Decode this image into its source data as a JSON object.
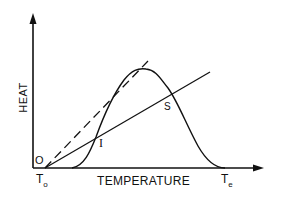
{
  "diagram": {
    "y_axis_label": "HEAT",
    "x_axis_label": "TEMPERATURE",
    "origin_label": "O",
    "t_start": {
      "main": "T",
      "sub": "o"
    },
    "t_end": {
      "main": "T",
      "sub": "e"
    },
    "points": {
      "intersection_i": "I",
      "intersection_s": "S"
    },
    "curves": [
      {
        "name": "heat-generation-curve",
        "style": "solid",
        "shape": "bell"
      },
      {
        "name": "heat-loss-line",
        "style": "solid",
        "shape": "straight"
      },
      {
        "name": "tangent-line",
        "style": "dashed",
        "shape": "straight"
      }
    ],
    "colors": {
      "ink": "#111111",
      "background": "#ffffff"
    }
  }
}
